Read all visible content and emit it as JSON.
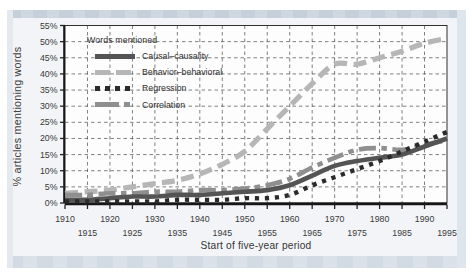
{
  "figure": {
    "y_axis_title": "% articles mentioning words",
    "x_axis_title": "Start of five-year period"
  },
  "legend": {
    "title": "Words mentioned"
  },
  "chart_data": {
    "type": "line",
    "title": "",
    "xlabel": "Start of five-year period",
    "ylabel": "% articles mentioning words",
    "x": [
      1910,
      1915,
      1920,
      1925,
      1930,
      1935,
      1940,
      1945,
      1950,
      1955,
      1960,
      1965,
      1970,
      1975,
      1980,
      1985,
      1990,
      1995
    ],
    "xlim": [
      1910,
      1995
    ],
    "ylim": [
      0,
      55
    ],
    "grid": true,
    "legend_position": "top-left",
    "y_tick_labels": [
      "0%",
      "5%",
      "10%",
      "15%",
      "20%",
      "25%",
      "30%",
      "35%",
      "40%",
      "45%",
      "50%",
      "55%"
    ],
    "x_ticks_row1": [
      "1910",
      "1920",
      "1930",
      "1940",
      "1950",
      "1960",
      "1970",
      "1980",
      "1990"
    ],
    "x_ticks_row2": [
      "1915",
      "1925",
      "1935",
      "1945",
      "1955",
      "1965",
      "1975",
      "1985",
      "1995"
    ],
    "series": [
      {
        "name": "Causal–causality",
        "color": "#545454",
        "style": "solid",
        "values": [
          1,
          1,
          1.5,
          2,
          2,
          2.5,
          2.5,
          3,
          3.5,
          4,
          5.5,
          8.5,
          11.5,
          13,
          14,
          15,
          17.5,
          20
        ]
      },
      {
        "name": "Behavior–behavioral",
        "color": "#b6b6b6",
        "style": "long-dash",
        "values": [
          3,
          3.5,
          4,
          5,
          6,
          7,
          9,
          12,
          16,
          23,
          30,
          37,
          43,
          43,
          45,
          47,
          49.5,
          51
        ]
      },
      {
        "name": "Regression",
        "color": "#2b2b2b",
        "style": "dotted",
        "values": [
          0.5,
          0.5,
          0.5,
          0.5,
          0.5,
          1,
          1,
          1,
          1.5,
          1.5,
          2.5,
          5.5,
          8,
          10.5,
          13,
          16,
          19,
          22
        ]
      },
      {
        "name": "Correlation",
        "color": "#8f8f8f",
        "style": "dash-dot",
        "values": [
          2.5,
          2.5,
          3,
          3,
          3.5,
          3.5,
          4,
          4,
          4.5,
          5.5,
          7.5,
          11,
          14,
          16.5,
          17,
          16.5,
          18,
          19.5
        ]
      }
    ]
  }
}
